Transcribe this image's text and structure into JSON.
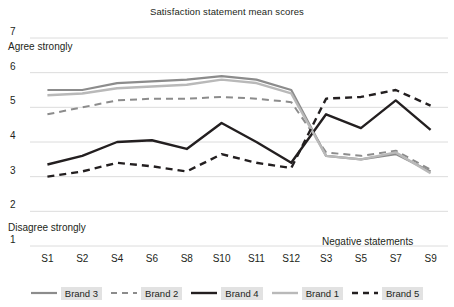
{
  "chart_data": {
    "type": "line",
    "title": "Satisfaction statement mean scores",
    "xlabel": "",
    "ylabel": "",
    "ylim": [
      1,
      7
    ],
    "yticks": [
      7,
      6,
      5,
      4,
      3,
      2,
      1
    ],
    "grid": true,
    "legend_position": "bottom",
    "annotations": [
      {
        "text": "Agree strongly",
        "near": "y-axis top"
      },
      {
        "text": "Disagree strongly",
        "near": "y-axis bottom"
      },
      {
        "text": "Negative statements",
        "near": "x-axis right"
      }
    ],
    "categories": [
      "S1",
      "S2",
      "S4",
      "S6",
      "S8",
      "S10",
      "S11",
      "S12",
      "S3",
      "S5",
      "S7",
      "S9"
    ],
    "series": [
      {
        "name": "Brand 3",
        "color": "#8c8c8c",
        "style": "solid",
        "width": 2.2,
        "values": [
          5.5,
          5.5,
          5.7,
          5.75,
          5.8,
          5.9,
          5.8,
          5.5,
          3.6,
          3.5,
          3.65,
          3.15
        ]
      },
      {
        "name": "Brand 2",
        "color": "#8c8c8c",
        "style": "dashed",
        "width": 2.0,
        "values": [
          4.8,
          5.0,
          5.2,
          5.25,
          5.25,
          5.3,
          5.25,
          5.15,
          3.7,
          3.6,
          3.75,
          3.2
        ]
      },
      {
        "name": "Brand 4",
        "color": "#231f20",
        "style": "solid",
        "width": 2.4,
        "values": [
          3.35,
          3.6,
          4.0,
          4.05,
          3.8,
          4.55,
          4.0,
          3.4,
          4.8,
          4.4,
          5.2,
          4.35
        ]
      },
      {
        "name": "Brand 1",
        "color": "#b9b9b9",
        "style": "solid",
        "width": 2.4,
        "values": [
          5.35,
          5.4,
          5.55,
          5.6,
          5.65,
          5.8,
          5.7,
          5.4,
          3.6,
          3.5,
          3.7,
          3.1
        ]
      },
      {
        "name": "Brand 5",
        "color": "#231f20",
        "style": "dashed",
        "width": 2.4,
        "values": [
          3.0,
          3.15,
          3.4,
          3.3,
          3.15,
          3.65,
          3.4,
          3.25,
          5.25,
          5.3,
          5.5,
          5.05
        ]
      }
    ]
  },
  "legend": {
    "items": [
      {
        "label": "Brand 3"
      },
      {
        "label": "Brand 2"
      },
      {
        "label": "Brand 4"
      },
      {
        "label": "Brand 1"
      },
      {
        "label": "Brand 5"
      }
    ]
  }
}
